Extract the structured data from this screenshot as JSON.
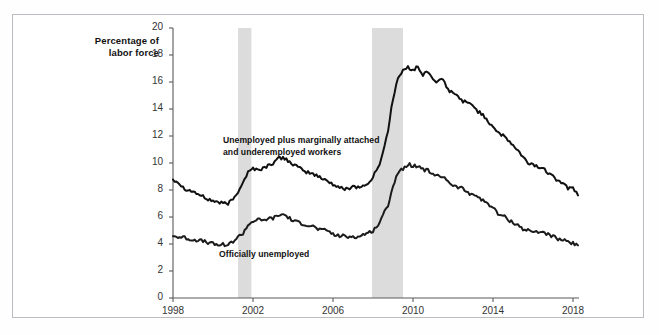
{
  "chart_data": {
    "type": "line",
    "title": "",
    "xlabel": "",
    "ylabel": "Percentage of\nlabor force",
    "xlim": [
      1998.0,
      2018.3
    ],
    "ylim": [
      0,
      20
    ],
    "yticks": [
      0,
      2,
      4,
      6,
      8,
      10,
      12,
      14,
      16,
      18,
      20
    ],
    "xticks": [
      1998,
      2002,
      2006,
      2010,
      2014,
      2018
    ],
    "grid": false,
    "legend_position": "inline-annotations",
    "annotations": [
      {
        "name": "u6-series-label",
        "text": "Unemployed plus marginally attached\nand underemployed workers",
        "x": 2000.5,
        "y": 11.6
      },
      {
        "name": "u3-series-label",
        "text": "Officially unemployed",
        "x": 2000.3,
        "y": 3.2
      }
    ],
    "shaded_regions": [
      {
        "name": "recession-2001",
        "x_start": 2001.25,
        "x_end": 2001.92,
        "color": "#dcdcdc"
      },
      {
        "name": "recession-2008",
        "x_start": 2007.95,
        "x_end": 2009.5,
        "color": "#dcdcdc"
      }
    ],
    "series": [
      {
        "name": "Unemployed plus marginally attached and underemployed workers",
        "color": "#111111",
        "x": [
          1998.0,
          1998.25,
          1998.5,
          1998.75,
          1999.0,
          1999.25,
          1999.5,
          1999.75,
          2000.0,
          2000.25,
          2000.5,
          2000.75,
          2001.0,
          2001.25,
          2001.5,
          2001.75,
          2002.0,
          2002.25,
          2002.5,
          2002.75,
          2003.0,
          2003.25,
          2003.5,
          2003.75,
          2004.0,
          2004.25,
          2004.5,
          2004.75,
          2005.0,
          2005.25,
          2005.5,
          2005.75,
          2006.0,
          2006.25,
          2006.5,
          2006.75,
          2007.0,
          2007.25,
          2007.5,
          2007.75,
          2008.0,
          2008.25,
          2008.5,
          2008.75,
          2009.0,
          2009.25,
          2009.5,
          2009.75,
          2010.0,
          2010.25,
          2010.5,
          2010.75,
          2011.0,
          2011.25,
          2011.5,
          2011.75,
          2012.0,
          2012.25,
          2012.5,
          2012.75,
          2013.0,
          2013.25,
          2013.5,
          2013.75,
          2014.0,
          2014.25,
          2014.5,
          2014.75,
          2015.0,
          2015.25,
          2015.5,
          2015.75,
          2016.0,
          2016.25,
          2016.5,
          2016.75,
          2017.0,
          2017.25,
          2017.5,
          2017.75,
          2018.0,
          2018.25
        ],
        "y": [
          8.8,
          8.6,
          8.2,
          8.0,
          7.9,
          7.7,
          7.5,
          7.3,
          7.2,
          7.1,
          7.0,
          7.0,
          7.3,
          7.9,
          8.6,
          9.3,
          9.6,
          9.5,
          9.6,
          9.8,
          10.0,
          10.3,
          10.4,
          10.2,
          9.9,
          9.7,
          9.4,
          9.3,
          9.2,
          9.0,
          8.8,
          8.7,
          8.4,
          8.2,
          8.1,
          8.1,
          8.3,
          8.2,
          8.3,
          8.4,
          9.0,
          9.6,
          10.8,
          12.4,
          14.8,
          16.3,
          16.8,
          17.1,
          16.9,
          17.1,
          16.5,
          16.8,
          16.2,
          16.0,
          16.2,
          15.4,
          15.2,
          14.9,
          14.6,
          14.4,
          14.3,
          13.8,
          13.6,
          13.1,
          12.7,
          12.3,
          12.0,
          11.7,
          11.3,
          10.9,
          10.4,
          10.0,
          9.9,
          9.7,
          9.6,
          9.3,
          9.2,
          8.6,
          8.6,
          8.1,
          8.2,
          7.6
        ]
      },
      {
        "name": "Officially unemployed",
        "color": "#1b1b1b",
        "x": [
          1998.0,
          1998.25,
          1998.5,
          1998.75,
          1999.0,
          1999.25,
          1999.5,
          1999.75,
          2000.0,
          2000.25,
          2000.5,
          2000.75,
          2001.0,
          2001.25,
          2001.5,
          2001.75,
          2002.0,
          2002.25,
          2002.5,
          2002.75,
          2003.0,
          2003.25,
          2003.5,
          2003.75,
          2004.0,
          2004.25,
          2004.5,
          2004.75,
          2005.0,
          2005.25,
          2005.5,
          2005.75,
          2006.0,
          2006.25,
          2006.5,
          2006.75,
          2007.0,
          2007.25,
          2007.5,
          2007.75,
          2008.0,
          2008.25,
          2008.5,
          2008.75,
          2009.0,
          2009.25,
          2009.5,
          2009.75,
          2010.0,
          2010.25,
          2010.5,
          2010.75,
          2011.0,
          2011.25,
          2011.5,
          2011.75,
          2012.0,
          2012.25,
          2012.5,
          2012.75,
          2013.0,
          2013.25,
          2013.5,
          2013.75,
          2014.0,
          2014.25,
          2014.5,
          2014.75,
          2015.0,
          2015.25,
          2015.5,
          2015.75,
          2016.0,
          2016.25,
          2016.5,
          2016.75,
          2017.0,
          2017.25,
          2017.5,
          2017.75,
          2018.0,
          2018.25
        ],
        "y": [
          4.6,
          4.5,
          4.5,
          4.4,
          4.3,
          4.3,
          4.2,
          4.1,
          4.0,
          3.9,
          4.0,
          3.9,
          4.2,
          4.5,
          4.8,
          5.4,
          5.7,
          5.8,
          5.7,
          5.9,
          5.9,
          6.1,
          6.2,
          6.0,
          5.7,
          5.6,
          5.5,
          5.4,
          5.3,
          5.1,
          5.0,
          5.0,
          4.7,
          4.6,
          4.6,
          4.5,
          4.6,
          4.5,
          4.7,
          4.8,
          5.0,
          5.4,
          6.1,
          6.9,
          8.3,
          9.3,
          9.6,
          9.9,
          9.8,
          9.8,
          9.5,
          9.5,
          9.1,
          9.0,
          9.0,
          8.7,
          8.3,
          8.2,
          8.1,
          7.8,
          7.7,
          7.5,
          7.2,
          7.0,
          6.7,
          6.2,
          6.1,
          5.8,
          5.6,
          5.4,
          5.1,
          5.0,
          4.9,
          4.9,
          4.9,
          4.7,
          4.6,
          4.3,
          4.3,
          4.1,
          4.1,
          3.9
        ]
      }
    ]
  },
  "axis": {
    "y_title": "Percentage of\nlabor force",
    "y_tick_labels": [
      "20",
      "18",
      "16",
      "14",
      "12",
      "10",
      "8",
      "6",
      "4",
      "2",
      "0"
    ],
    "x_tick_labels": [
      "1998",
      "2002",
      "2006",
      "2010",
      "2014",
      "2018"
    ]
  }
}
